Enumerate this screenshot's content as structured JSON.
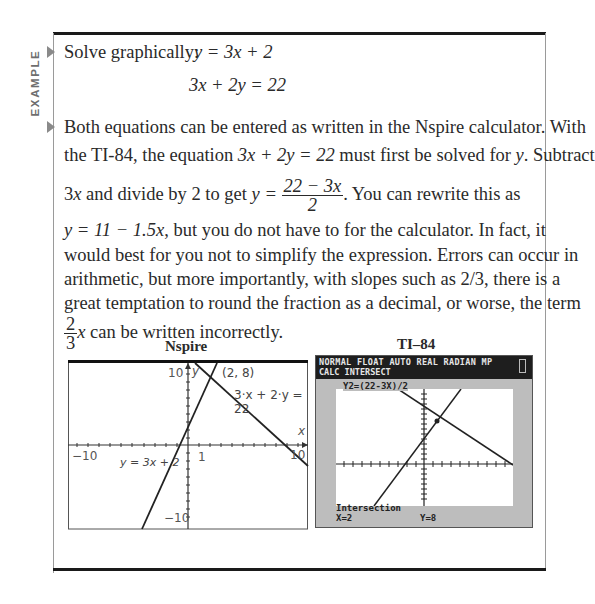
{
  "side_label": "EXAMPLE",
  "problem": {
    "intro": "Solve graphically:",
    "eq1": "y = 3x + 2",
    "eq2": "3x + 2y = 22"
  },
  "explanation": {
    "line1": "Both equations can be entered as written in the Nspire calculator. With",
    "line2_a": "the TI-84, the equation ",
    "line2_eq": "3x + 2y = 22",
    "line2_b": " must first be solved for ",
    "line2_y": "y",
    "line2_c": ". Subtract",
    "line3_a": "3",
    "line3_x": "x",
    "line3_b": " and divide by 2 to get ",
    "line3_eq_lhs": "y =",
    "line3_frac_num": "22 − 3x",
    "line3_frac_den": "2",
    "line3_c": ". You can rewrite this as",
    "line4_eq": "y = 11 − 1.5x",
    "line4_b": ", but you do not have to for the calculator. In fact, it",
    "line5": "would best for you not to simplify the expression. Errors can occur in",
    "line6": "arithmetic, but more importantly, with slopes such as 2/3, there is a",
    "line7": "great temptation to round the fraction as a decimal, or worse, the term",
    "line8_frac_num": "2",
    "line8_frac_den": "3",
    "line8_x": "x",
    "line8_b": " can be written incorrectly."
  },
  "nspire": {
    "caption": "Nspire",
    "label_y_top": "10",
    "label_y_axis": "y",
    "label_point": "(2, 8)",
    "label_line2": "3·x + 2·y = 22",
    "label_x_axis": "x",
    "label_x_min": "−10",
    "label_line1": "y = 3x + 2",
    "label_x_tick1": "1",
    "label_x_max": "10",
    "label_y_bottom": "−10"
  },
  "ti84": {
    "caption": "TI–84",
    "status_line": "NORMAL FLOAT AUTO REAL RADIAN MP",
    "mode_line": "CALC INTERSECT",
    "equation_label": "Y2=(22-3X)/2",
    "result_title": "Intersection",
    "result_x": "X=2",
    "result_y": "Y=8"
  },
  "colors": {
    "frame": "#1a1a1a",
    "bullet": "#8a8a8a",
    "side_label": "#6e6e6e",
    "ti_header": "#1e1e1e",
    "ti_bezel": "#bdbdbd"
  }
}
